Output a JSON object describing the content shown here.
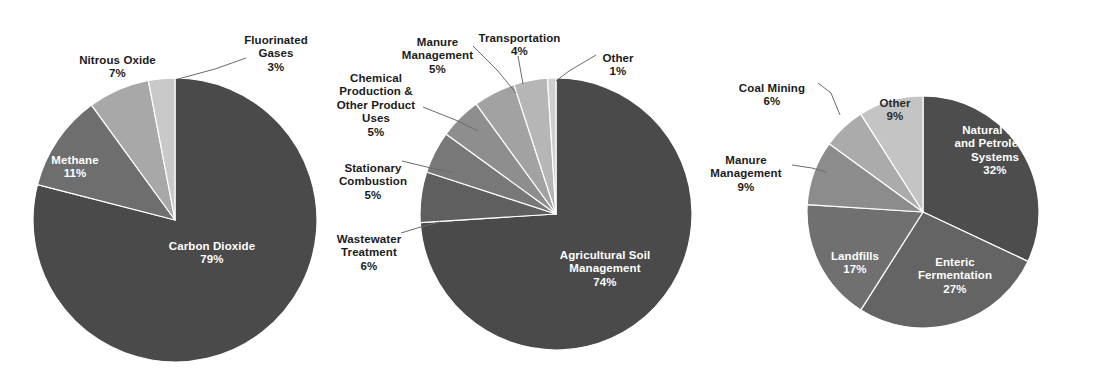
{
  "figure": {
    "background": "#ffffff",
    "width": 1096,
    "height": 375,
    "label_text_color": "#1b1b1b",
    "inside_label_text_color": "#ffffff"
  },
  "chart_data": [
    {
      "type": "pie",
      "title": "",
      "id": "greenhouse-gas-by-gas",
      "center": [
        175,
        220
      ],
      "radius": 142,
      "start_angle_deg": 0,
      "direction": "clockwise",
      "categories": [
        "Carbon Dioxide",
        "Methane",
        "Nitrous Oxide",
        "Fluorinated Gases"
      ],
      "values": [
        79,
        11,
        7,
        3
      ],
      "value_suffix": "%",
      "colors": [
        "#4a4a4a",
        "#6e6e6e",
        "#a8a8a8",
        "#c9c9c9"
      ],
      "slices": [
        {
          "label": "Carbon Dioxide",
          "value": 79,
          "value_label": "79%",
          "color": "#4a4a4a",
          "label_placement": "inside"
        },
        {
          "label": "Methane",
          "value": 11,
          "value_label": "11%",
          "color": "#6e6e6e",
          "label_placement": "inside"
        },
        {
          "label": "Nitrous Oxide",
          "value": 7,
          "value_label": "7%",
          "color": "#a8a8a8",
          "label_placement": "outside"
        },
        {
          "label": "Fluorinated\nGases",
          "value": 3,
          "value_label": "3%",
          "color": "#c9c9c9",
          "label_placement": "outside"
        }
      ],
      "legend": "none",
      "grid": false
    },
    {
      "type": "pie",
      "title": "",
      "id": "nitrous-oxide-sources",
      "center": [
        556,
        214
      ],
      "radius": 136,
      "start_angle_deg": 0,
      "direction": "clockwise",
      "categories": [
        "Agricultural Soil Management",
        "Wastewater Treatment",
        "Stationary Combustion",
        "Chemical Production & Other Product Uses",
        "Manure Management",
        "Transportation",
        "Other"
      ],
      "values": [
        74,
        6,
        5,
        5,
        5,
        4,
        1
      ],
      "value_suffix": "%",
      "colors": [
        "#4a4a4a",
        "#5f5f5f",
        "#787878",
        "#8e8e8e",
        "#a2a2a2",
        "#b6b6b6",
        "#cfcfcf"
      ],
      "slices": [
        {
          "label": "Agricultural Soil\nManagement",
          "value": 74,
          "value_label": "74%",
          "color": "#4a4a4a",
          "label_placement": "inside"
        },
        {
          "label": "Wastewater\nTreatment",
          "value": 6,
          "value_label": "6%",
          "color": "#5f5f5f",
          "label_placement": "outside"
        },
        {
          "label": "Stationary\nCombustion",
          "value": 5,
          "value_label": "5%",
          "color": "#787878",
          "label_placement": "outside"
        },
        {
          "label": "Chemical\nProduction &\nOther Product\nUses",
          "value": 5,
          "value_label": "5%",
          "color": "#8e8e8e",
          "label_placement": "outside"
        },
        {
          "label": "Manure\nManagement",
          "value": 5,
          "value_label": "5%",
          "color": "#a2a2a2",
          "label_placement": "outside"
        },
        {
          "label": "Transportation",
          "value": 4,
          "value_label": "4%",
          "color": "#b6b6b6",
          "label_placement": "outside"
        },
        {
          "label": "Other",
          "value": 1,
          "value_label": "1%",
          "color": "#cfcfcf",
          "label_placement": "outside"
        }
      ],
      "legend": "none",
      "grid": false
    },
    {
      "type": "pie",
      "title": "",
      "id": "methane-sources",
      "center": [
        923,
        212
      ],
      "radius": 116,
      "start_angle_deg": 0,
      "direction": "clockwise",
      "categories": [
        "Natural Gas and Petroleum Systems",
        "Enteric Fermentation",
        "Landfills",
        "Manure Management",
        "Coal Mining",
        "Other"
      ],
      "values": [
        32,
        27,
        17,
        9,
        6,
        9
      ],
      "value_suffix": "%",
      "colors": [
        "#4d4d4d",
        "#646464",
        "#707070",
        "#8c8c8c",
        "#ababab",
        "#c4c4c4"
      ],
      "slices": [
        {
          "label": "Natural Gas\nand Petroleum\nSystems",
          "value": 32,
          "value_label": "32%",
          "color": "#4d4d4d",
          "label_placement": "inside"
        },
        {
          "label": "Enteric\nFermentation",
          "value": 27,
          "value_label": "27%",
          "color": "#646464",
          "label_placement": "inside"
        },
        {
          "label": "Landfills",
          "value": 17,
          "value_label": "17%",
          "color": "#707070",
          "label_placement": "inside"
        },
        {
          "label": "Manure\nManagement",
          "value": 9,
          "value_label": "9%",
          "color": "#8c8c8c",
          "label_placement": "outside"
        },
        {
          "label": "Coal Mining",
          "value": 6,
          "value_label": "6%",
          "color": "#ababab",
          "label_placement": "outside"
        },
        {
          "label": "Other",
          "value": 9,
          "value_label": "9%",
          "color": "#c4c4c4",
          "label_placement": "inside"
        }
      ],
      "legend": "none",
      "grid": false
    }
  ],
  "labels": {
    "chart1": {
      "carbon_dioxide": {
        "name": "Carbon Dioxide",
        "value": "79%"
      },
      "methane": {
        "name": "Methane",
        "value": "11%"
      },
      "nitrous_oxide": {
        "name": "Nitrous Oxide",
        "value": "7%"
      },
      "fluorinated_gases": {
        "name": "Fluorinated\nGases",
        "value": "3%"
      }
    },
    "chart2": {
      "agricultural_soil_management": {
        "name": "Agricultural Soil\nManagement",
        "value": "74%"
      },
      "wastewater_treatment": {
        "name": "Wastewater\nTreatment",
        "value": "6%"
      },
      "stationary_combustion": {
        "name": "Stationary\nCombustion",
        "value": "5%"
      },
      "chemical_production": {
        "name": "Chemical\nProduction &\nOther Product\nUses",
        "value": "5%"
      },
      "manure_management": {
        "name": "Manure\nManagement",
        "value": "5%"
      },
      "transportation": {
        "name": "Transportation",
        "value": "4%"
      },
      "other": {
        "name": "Other",
        "value": "1%"
      }
    },
    "chart3": {
      "natural_gas_petroleum": {
        "name": "Natural Gas\nand Petroleum\nSystems",
        "value": "32%"
      },
      "enteric_fermentation": {
        "name": "Enteric\nFermentation",
        "value": "27%"
      },
      "landfills": {
        "name": "Landfills",
        "value": "17%"
      },
      "manure_management": {
        "name": "Manure\nManagement",
        "value": "9%"
      },
      "coal_mining": {
        "name": "Coal Mining",
        "value": "6%"
      },
      "other": {
        "name": "Other",
        "value": "9%"
      }
    }
  }
}
